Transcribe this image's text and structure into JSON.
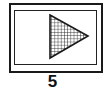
{
  "icon": {
    "name": "play-triangle-hatched",
    "frame_color": "#1a1a1a",
    "fill_pattern": "crosshatch"
  },
  "label": "5"
}
